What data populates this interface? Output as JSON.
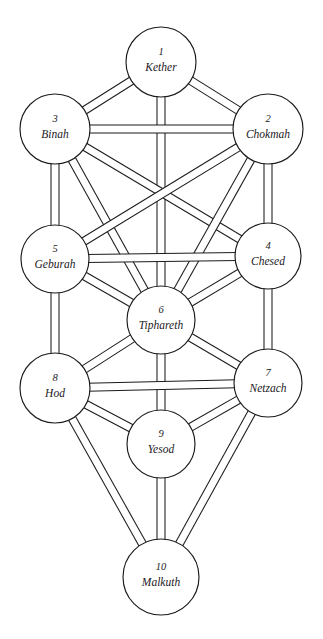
{
  "diagram": {
    "type": "node-link-diagram",
    "width": 323,
    "height": 639,
    "background_color": "#ffffff",
    "stroke_color": "#1b1b1b",
    "text_color": "#23201e",
    "path_style": "double-line ribbon",
    "path_band_width": 8,
    "sephiroth": [
      {
        "id": "kether",
        "number": "1",
        "name": "Kether",
        "cx": 161,
        "cy": 62,
        "r": 35
      },
      {
        "id": "chokmah",
        "number": "2",
        "name": "Chokmah",
        "cx": 268,
        "cy": 129,
        "r": 35
      },
      {
        "id": "binah",
        "number": "3",
        "name": "Binah",
        "cx": 55,
        "cy": 129,
        "r": 35
      },
      {
        "id": "chesed",
        "number": "4",
        "name": "Chesed",
        "cx": 268,
        "cy": 256,
        "r": 33
      },
      {
        "id": "geburah",
        "number": "5",
        "name": "Geburah",
        "cx": 55,
        "cy": 259,
        "r": 34
      },
      {
        "id": "tiphareth",
        "number": "6",
        "name": "Tiphareth",
        "cx": 161,
        "cy": 320,
        "r": 34
      },
      {
        "id": "netzach",
        "number": "7",
        "name": "Netzach",
        "cx": 268,
        "cy": 383,
        "r": 34
      },
      {
        "id": "hod",
        "number": "8",
        "name": "Hod",
        "cx": 55,
        "cy": 388,
        "r": 35
      },
      {
        "id": "yesod",
        "number": "9",
        "name": "Yesod",
        "cx": 161,
        "cy": 444,
        "r": 34
      },
      {
        "id": "malkuth",
        "number": "10",
        "name": "Malkuth",
        "cx": 161,
        "cy": 577,
        "r": 38
      }
    ],
    "paths": [
      {
        "from": "kether",
        "to": "chokmah"
      },
      {
        "from": "kether",
        "to": "binah"
      },
      {
        "from": "kether",
        "to": "tiphareth"
      },
      {
        "from": "binah",
        "to": "chokmah"
      },
      {
        "from": "binah",
        "to": "geburah"
      },
      {
        "from": "binah",
        "to": "tiphareth"
      },
      {
        "from": "binah",
        "to": "chesed"
      },
      {
        "from": "chokmah",
        "to": "chesed"
      },
      {
        "from": "chokmah",
        "to": "tiphareth"
      },
      {
        "from": "chokmah",
        "to": "geburah"
      },
      {
        "from": "geburah",
        "to": "chesed"
      },
      {
        "from": "geburah",
        "to": "tiphareth"
      },
      {
        "from": "geburah",
        "to": "hod"
      },
      {
        "from": "chesed",
        "to": "tiphareth"
      },
      {
        "from": "chesed",
        "to": "netzach"
      },
      {
        "from": "tiphareth",
        "to": "netzach"
      },
      {
        "from": "tiphareth",
        "to": "hod"
      },
      {
        "from": "tiphareth",
        "to": "yesod"
      },
      {
        "from": "netzach",
        "to": "hod"
      },
      {
        "from": "netzach",
        "to": "yesod"
      },
      {
        "from": "netzach",
        "to": "malkuth"
      },
      {
        "from": "hod",
        "to": "yesod"
      },
      {
        "from": "hod",
        "to": "malkuth"
      },
      {
        "from": "yesod",
        "to": "malkuth"
      }
    ]
  }
}
